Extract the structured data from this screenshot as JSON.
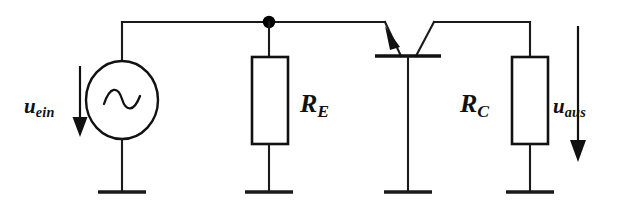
{
  "diagram": {
    "background_color": "#ffffff",
    "line_color": "#111111",
    "labels": {
      "input_voltage": {
        "symbol": "u",
        "subscript": "ein"
      },
      "output_voltage": {
        "symbol": "u",
        "subscript": "aus"
      },
      "resistor_emitter": {
        "symbol": "R",
        "subscript": "E"
      },
      "resistor_collector": {
        "symbol": "R",
        "subscript": "C"
      }
    },
    "components": [
      {
        "id": "ac-source",
        "type": "ac-voltage-source",
        "glyph": "sine-wave",
        "label": "u_ein"
      },
      {
        "id": "resistor-RE",
        "type": "resistor",
        "shape": "rectangle",
        "label": "R_E"
      },
      {
        "id": "transistor",
        "type": "bipolar-junction-transistor",
        "polarity": "npn",
        "orientation": "rotated-base-down"
      },
      {
        "id": "resistor-RC",
        "type": "resistor",
        "shape": "rectangle",
        "label": "R_C"
      },
      {
        "id": "ground-1",
        "type": "ground",
        "shape": "single-bar"
      },
      {
        "id": "ground-2",
        "type": "ground",
        "shape": "single-bar"
      },
      {
        "id": "ground-3",
        "type": "ground",
        "shape": "single-bar"
      },
      {
        "id": "ground-4",
        "type": "ground",
        "shape": "single-bar"
      }
    ],
    "annotations": [
      {
        "id": "arrow-uein",
        "type": "voltage-arrow",
        "direction": "down",
        "label": "u_ein"
      },
      {
        "id": "arrow-uaus",
        "type": "voltage-arrow",
        "direction": "down",
        "label": "u_aus"
      },
      {
        "id": "junction-dot",
        "type": "node-junction"
      }
    ]
  }
}
